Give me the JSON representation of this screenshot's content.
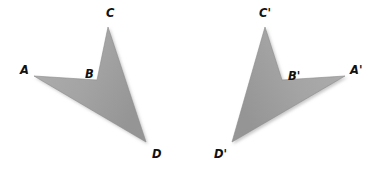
{
  "figure": {
    "background_color": "#ffffff",
    "canvas": {
      "width": 370,
      "height": 172
    }
  },
  "style": {
    "fill_color": "#a3a3a3",
    "fill_color_dark": "#8f8f8f",
    "edge_color": "#7a7a7a",
    "shadow_color": "#c9c9c9",
    "label_color": "#111111"
  },
  "shapes": [
    {
      "id": "shape-original",
      "name": "quadrilateral-abcd",
      "points": "34,76 97,80 108,27 146,142",
      "vertices": [
        {
          "key": "A",
          "label": "A",
          "x": 34,
          "y": 76,
          "label_x": 20,
          "label_y": 70
        },
        {
          "key": "B",
          "label": "B",
          "x": 97,
          "y": 80,
          "label_x": 85,
          "label_y": 74
        },
        {
          "key": "C",
          "label": "C",
          "x": 108,
          "y": 27,
          "label_x": 106,
          "label_y": 13
        },
        {
          "key": "D",
          "label": "D",
          "x": 146,
          "y": 142,
          "label_x": 152,
          "label_y": 154
        }
      ]
    },
    {
      "id": "shape-image",
      "name": "quadrilateral-a-prime-b-prime-c-prime-d-prime",
      "points": "345,76 282,80 265,27 232,142",
      "vertices": [
        {
          "key": "A'",
          "label": "A'",
          "x": 345,
          "y": 76,
          "label_x": 350,
          "label_y": 70
        },
        {
          "key": "B'",
          "label": "B'",
          "x": 282,
          "y": 80,
          "label_x": 288,
          "label_y": 76
        },
        {
          "key": "C'",
          "label": "C'",
          "x": 265,
          "y": 27,
          "label_x": 259,
          "label_y": 13
        },
        {
          "key": "D'",
          "label": "D'",
          "x": 232,
          "y": 142,
          "label_x": 214,
          "label_y": 154
        }
      ]
    }
  ]
}
